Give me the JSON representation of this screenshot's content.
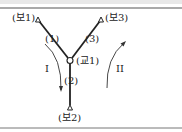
{
  "figure": {
    "top_cutoff_text": "",
    "nodes": [
      {
        "id": "bo1",
        "label": "(보1)",
        "type": "endpoint-triangle"
      },
      {
        "id": "bo3",
        "label": "(보3)",
        "type": "endpoint-triangle"
      },
      {
        "id": "gyo1",
        "label": "(교1)",
        "type": "junction-circle"
      },
      {
        "id": "bo2",
        "label": "(보2)",
        "type": "endpoint-triangle"
      }
    ],
    "segments": [
      {
        "id": "seg1",
        "label": "(1)",
        "from": "bo1",
        "to": "gyo1"
      },
      {
        "id": "seg3",
        "label": "(3)",
        "from": "bo3",
        "to": "gyo1"
      },
      {
        "id": "seg2",
        "label": "(2)",
        "from": "gyo1",
        "to": "bo2"
      }
    ],
    "flows": [
      {
        "id": "flow1",
        "label": "I",
        "direction": "down"
      },
      {
        "id": "flow2",
        "label": "II",
        "direction": "up"
      }
    ],
    "colors": {
      "line": "#222222",
      "rule": "#555555",
      "background": "#ffffff"
    }
  }
}
